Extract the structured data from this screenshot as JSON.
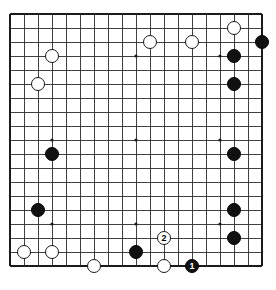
{
  "diagram": {
    "kind": "go-board-diagram",
    "board_size": 19,
    "title": "",
    "colors": {
      "background": "#ffffff",
      "grid_line": "#2b2b2b",
      "border_line": "#1a1a1a",
      "black_stone": "#111111",
      "white_stone": "#ffffff",
      "stone_outline": "#1a1a1a",
      "star_point": "#1a1a1a"
    },
    "geometry": {
      "left": 10,
      "top": 14,
      "spacing": 14,
      "stone_diameter": 14
    },
    "star_points": [
      {
        "col": 3,
        "row": 3
      },
      {
        "col": 9,
        "row": 3
      },
      {
        "col": 15,
        "row": 3
      },
      {
        "col": 3,
        "row": 9
      },
      {
        "col": 9,
        "row": 9
      },
      {
        "col": 15,
        "row": 9
      },
      {
        "col": 3,
        "row": 15
      },
      {
        "col": 9,
        "row": 15
      },
      {
        "col": 15,
        "row": 15
      }
    ],
    "stones": [
      {
        "color": "white",
        "col": 16,
        "row": 1,
        "label": "",
        "name": "white-stone-q18"
      },
      {
        "color": "black",
        "col": 18,
        "row": 2,
        "label": "",
        "name": "black-stone-s17"
      },
      {
        "color": "white",
        "col": 10,
        "row": 2,
        "label": "",
        "name": "white-stone-k17"
      },
      {
        "color": "white",
        "col": 13,
        "row": 2,
        "label": "",
        "name": "white-stone-n17"
      },
      {
        "color": "black",
        "col": 16,
        "row": 3,
        "label": "",
        "name": "black-stone-q16"
      },
      {
        "color": "white",
        "col": 3,
        "row": 3,
        "label": "",
        "name": "white-stone-d16"
      },
      {
        "color": "white",
        "col": 2,
        "row": 5,
        "label": "",
        "name": "white-stone-c14"
      },
      {
        "color": "black",
        "col": 16,
        "row": 5,
        "label": "",
        "name": "black-stone-q14"
      },
      {
        "color": "black",
        "col": 16,
        "row": 10,
        "label": "",
        "name": "black-stone-q9"
      },
      {
        "color": "black",
        "col": 3,
        "row": 10,
        "label": "",
        "name": "black-stone-d9"
      },
      {
        "color": "black",
        "col": 2,
        "row": 14,
        "label": "",
        "name": "black-stone-c5"
      },
      {
        "color": "black",
        "col": 16,
        "row": 14,
        "label": "",
        "name": "black-stone-q5"
      },
      {
        "color": "white",
        "col": 11,
        "row": 16,
        "label": "2",
        "name": "white-stone-move-2"
      },
      {
        "color": "white",
        "col": 1,
        "row": 17,
        "label": "",
        "name": "white-stone-b2"
      },
      {
        "color": "white",
        "col": 3,
        "row": 17,
        "label": "",
        "name": "white-stone-d2"
      },
      {
        "color": "black",
        "col": 9,
        "row": 17,
        "label": "",
        "name": "black-stone-k2"
      },
      {
        "color": "black",
        "col": 16,
        "row": 16,
        "label": "",
        "name": "black-stone-q3"
      },
      {
        "color": "white",
        "col": 6,
        "row": 18,
        "label": "",
        "name": "white-stone-g1"
      },
      {
        "color": "white",
        "col": 11,
        "row": 18,
        "label": "",
        "name": "white-stone-m1"
      },
      {
        "color": "black",
        "col": 13,
        "row": 18,
        "label": "1",
        "name": "black-stone-move-1"
      }
    ]
  }
}
